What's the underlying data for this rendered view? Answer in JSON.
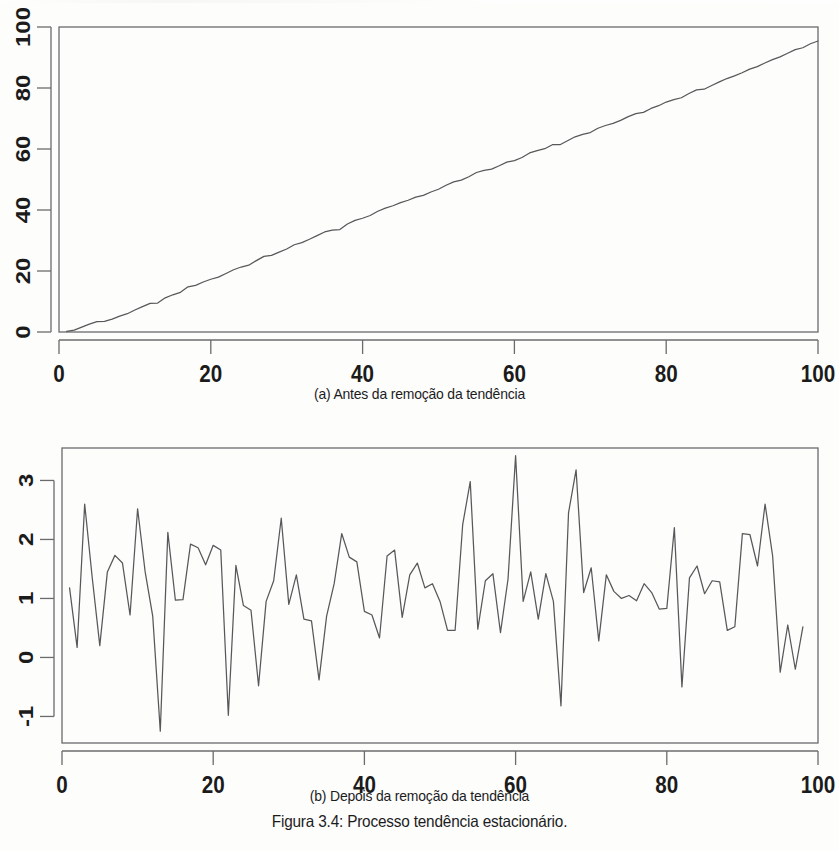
{
  "figure": {
    "caption_a": "(a) Antes da remoção da tendência",
    "caption_b": "(b) Depois da remoção da tendência",
    "caption_main": "Figura 3.4: Processo tendência estacionário.",
    "line_color": "#58585a",
    "axis_color": "#6b6b6d",
    "text_color": "#1b1b1b"
  },
  "chart_data": [
    {
      "type": "line",
      "id": "antes",
      "title": "(a) Antes da remoção da tendência",
      "xlabel": "",
      "ylabel": "",
      "xlim": [
        0,
        100
      ],
      "ylim": [
        0,
        100
      ],
      "xticks": [
        0,
        20,
        40,
        60,
        80,
        100
      ],
      "yticks": [
        0,
        20,
        40,
        60,
        80,
        100
      ],
      "grid": false,
      "legend": "none",
      "x": [
        1,
        2,
        3,
        4,
        5,
        6,
        7,
        8,
        9,
        10,
        11,
        12,
        13,
        14,
        15,
        16,
        17,
        18,
        19,
        20,
        21,
        22,
        23,
        24,
        25,
        26,
        27,
        28,
        29,
        30,
        31,
        32,
        33,
        34,
        35,
        36,
        37,
        38,
        39,
        40,
        41,
        42,
        43,
        44,
        45,
        46,
        47,
        48,
        49,
        50,
        51,
        52,
        53,
        54,
        55,
        56,
        57,
        58,
        59,
        60,
        61,
        62,
        63,
        64,
        65,
        66,
        67,
        68,
        69,
        70,
        71,
        72,
        73,
        74,
        75,
        76,
        77,
        78,
        79,
        80,
        81,
        82,
        83,
        84,
        85,
        86,
        87,
        88,
        89,
        90,
        91,
        92,
        93,
        94,
        95,
        96,
        97,
        98,
        99,
        100
      ],
      "values": [
        0.2,
        0.6,
        1.6,
        2.6,
        3.4,
        3.5,
        4.2,
        5.2,
        6.0,
        7.2,
        8.3,
        9.4,
        9.5,
        11.2,
        12.2,
        13.0,
        14.8,
        15.3,
        16.4,
        17.3,
        18.0,
        19.2,
        20.4,
        21.3,
        21.9,
        23.4,
        24.8,
        25.1,
        26.2,
        27.2,
        28.6,
        29.3,
        30.4,
        31.6,
        32.8,
        33.4,
        33.6,
        35.4,
        36.6,
        37.3,
        38.2,
        39.6,
        40.6,
        41.4,
        42.4,
        43.2,
        44.2,
        44.8,
        45.9,
        46.8,
        48.1,
        49.2,
        49.8,
        50.9,
        52.3,
        53.0,
        53.4,
        54.5,
        55.7,
        56.2,
        57.2,
        58.7,
        59.5,
        60.1,
        61.4,
        61.4,
        62.7,
        64.0,
        64.8,
        65.4,
        66.8,
        67.7,
        68.4,
        69.4,
        70.6,
        71.6,
        72.0,
        73.3,
        74.2,
        75.4,
        76.2,
        76.8,
        78.2,
        79.4,
        79.6,
        80.8,
        82.0,
        83.1,
        84.0,
        85.0,
        86.2,
        87.0,
        88.2,
        89.3,
        90.2,
        91.4,
        92.6,
        93.2,
        94.5,
        95.4
      ]
    },
    {
      "type": "line",
      "id": "depois",
      "title": "(b) Depois da remoção da tendência",
      "xlabel": "",
      "ylabel": "",
      "xlim": [
        0,
        100
      ],
      "ylim": [
        -1.45,
        3.55
      ],
      "xticks": [
        0,
        20,
        40,
        60,
        80,
        100
      ],
      "yticks": [
        -1,
        0,
        1,
        2,
        3
      ],
      "grid": false,
      "legend": "none",
      "x": [
        1,
        2,
        3,
        4,
        5,
        6,
        7,
        8,
        9,
        10,
        11,
        12,
        13,
        14,
        15,
        16,
        17,
        18,
        19,
        20,
        21,
        22,
        23,
        24,
        25,
        26,
        27,
        28,
        29,
        30,
        31,
        32,
        33,
        34,
        35,
        36,
        37,
        38,
        39,
        40,
        41,
        42,
        43,
        44,
        45,
        46,
        47,
        48,
        49,
        50,
        51,
        52,
        53,
        54,
        55,
        56,
        57,
        58,
        59,
        60,
        61,
        62,
        63,
        64,
        65,
        66,
        67,
        68,
        69,
        70,
        71,
        72,
        73,
        74,
        75,
        76,
        77,
        78,
        79,
        80,
        81,
        82,
        83,
        84,
        85,
        86,
        87,
        88,
        89,
        90,
        91,
        92,
        93,
        94,
        95,
        96,
        97,
        98,
        99
      ],
      "values": [
        1.18,
        0.17,
        2.6,
        1.35,
        0.2,
        1.45,
        1.73,
        1.6,
        0.72,
        2.52,
        1.45,
        0.7,
        -1.25,
        2.12,
        0.97,
        0.98,
        1.92,
        1.86,
        1.57,
        1.9,
        1.82,
        -0.98,
        1.56,
        0.88,
        0.8,
        -0.48,
        0.95,
        1.3,
        2.36,
        0.9,
        1.4,
        0.65,
        0.62,
        -0.38,
        0.7,
        1.25,
        2.1,
        1.7,
        1.62,
        0.78,
        0.72,
        0.33,
        1.72,
        1.82,
        0.68,
        1.4,
        1.6,
        1.18,
        1.25,
        0.95,
        0.46,
        0.46,
        2.25,
        2.98,
        0.48,
        1.3,
        1.42,
        0.42,
        1.33,
        3.42,
        0.95,
        1.45,
        0.65,
        1.42,
        0.95,
        -0.82,
        2.45,
        3.18,
        1.1,
        1.52,
        0.28,
        1.4,
        1.12,
        1.0,
        1.05,
        0.96,
        1.25,
        1.1,
        0.82,
        0.83,
        2.2,
        -0.5,
        1.35,
        1.55,
        1.08,
        1.3,
        1.28,
        0.46,
        0.52,
        2.1,
        2.08,
        1.55,
        2.6,
        1.72,
        -0.25,
        0.55,
        -0.2,
        0.52
      ]
    }
  ]
}
